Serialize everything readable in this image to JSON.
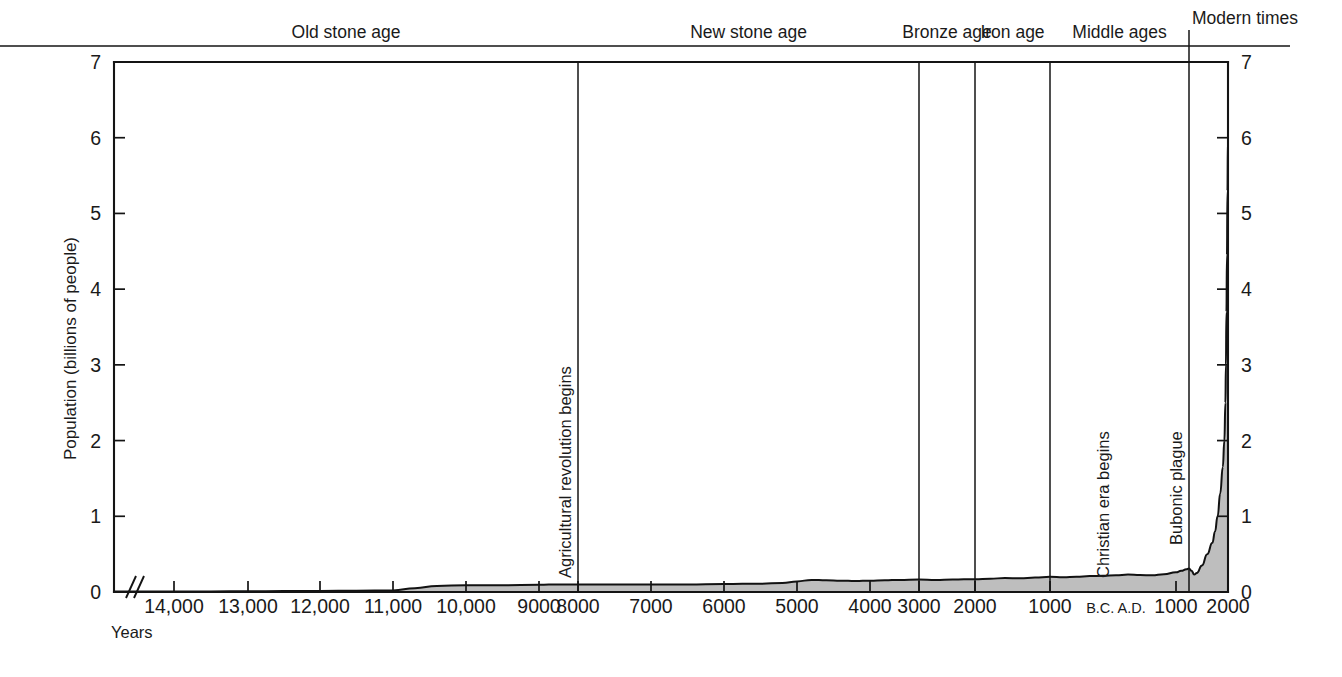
{
  "chart_data": {
    "type": "area",
    "title": "",
    "xlabel": "Years",
    "ylabel": "Population (billions of people)",
    "ylim": [
      0,
      7
    ],
    "grid": false,
    "legend": "none",
    "y_ticks": [
      "0",
      "1",
      "2",
      "3",
      "4",
      "5",
      "6",
      "7"
    ],
    "y_tick_values": [
      0,
      1,
      2,
      3,
      4,
      5,
      6,
      7
    ],
    "y_axis_both_sides": true,
    "x_axis_note": "Time axis running from about 15,000 B.C. on the left to A.D. 2000 on the right, with a break near the left end.",
    "x_ticks": [
      {
        "label": "14,000",
        "era": "B.C.",
        "year": -14000
      },
      {
        "label": "13,000",
        "era": "B.C.",
        "year": -13000
      },
      {
        "label": "12,000",
        "era": "B.C.",
        "year": -12000
      },
      {
        "label": "11,000",
        "era": "B.C.",
        "year": -11000
      },
      {
        "label": "10,000",
        "era": "B.C.",
        "year": -10000
      },
      {
        "label": "9000",
        "era": "B.C.",
        "year": -9000
      },
      {
        "label": "8000",
        "era": "B.C.",
        "year": -8000
      },
      {
        "label": "7000",
        "era": "B.C.",
        "year": -7000
      },
      {
        "label": "6000",
        "era": "B.C.",
        "year": -6000
      },
      {
        "label": "5000",
        "era": "B.C.",
        "year": -5000
      },
      {
        "label": "4000",
        "era": "B.C.",
        "year": -4000
      },
      {
        "label": "3000",
        "era": "B.C.",
        "year": -3000
      },
      {
        "label": "2000",
        "era": "B.C.",
        "year": -2000
      },
      {
        "label": "1000",
        "era": "B.C.",
        "year": -1000
      },
      {
        "label": "B.C. A.D.",
        "era": "boundary",
        "year": 0
      },
      {
        "label": "1000",
        "era": "A.D.",
        "year": 1000
      },
      {
        "label": "2000",
        "era": "A.D.",
        "year": 2000
      }
    ],
    "eras": [
      {
        "label": "Old stone age",
        "start_year": -15000,
        "end_year": -8000
      },
      {
        "label": "New stone age",
        "start_year": -8000,
        "end_year": -3000
      },
      {
        "label": "Bronze age",
        "start_year": -3000,
        "end_year": -2000
      },
      {
        "label": "Iron age",
        "start_year": -2000,
        "end_year": -1000
      },
      {
        "label": "Middle ages",
        "start_year": -1000,
        "end_year": 1250
      },
      {
        "label": "Modern times",
        "start_year": 1250,
        "end_year": 2000
      }
    ],
    "era_divider_years": [
      -8000,
      -3000,
      -2000,
      -1000,
      1250
    ],
    "annotations": [
      {
        "label": "Agricultural revolution begins",
        "year": -8000,
        "orientation": "vertical"
      },
      {
        "label": "Christian era begins",
        "year": 0,
        "orientation": "vertical"
      },
      {
        "label": "Bubonic plague",
        "year": 1250,
        "orientation": "vertical"
      }
    ],
    "series": [
      {
        "name": "World population",
        "units": "billions of people",
        "points": [
          {
            "year": -15000,
            "value": 0.005
          },
          {
            "year": -14500,
            "value": 0.006
          },
          {
            "year": -14000,
            "value": 0.007
          },
          {
            "year": -13500,
            "value": 0.008
          },
          {
            "year": -13000,
            "value": 0.01
          },
          {
            "year": -12500,
            "value": 0.012
          },
          {
            "year": -12000,
            "value": 0.014
          },
          {
            "year": -11500,
            "value": 0.017
          },
          {
            "year": -11000,
            "value": 0.02
          },
          {
            "year": -10700,
            "value": 0.05
          },
          {
            "year": -10400,
            "value": 0.08
          },
          {
            "year": -10000,
            "value": 0.09
          },
          {
            "year": -9500,
            "value": 0.09
          },
          {
            "year": -9000,
            "value": 0.095
          },
          {
            "year": -8500,
            "value": 0.1
          },
          {
            "year": -8000,
            "value": 0.1
          },
          {
            "year": -7500,
            "value": 0.1
          },
          {
            "year": -7000,
            "value": 0.1
          },
          {
            "year": -6500,
            "value": 0.1
          },
          {
            "year": -6000,
            "value": 0.105
          },
          {
            "year": -5500,
            "value": 0.11
          },
          {
            "year": -5200,
            "value": 0.12
          },
          {
            "year": -5000,
            "value": 0.14
          },
          {
            "year": -4800,
            "value": 0.16
          },
          {
            "year": -4600,
            "value": 0.155
          },
          {
            "year": -4400,
            "value": 0.15
          },
          {
            "year": -4200,
            "value": 0.145
          },
          {
            "year": -4000,
            "value": 0.15
          },
          {
            "year": -3700,
            "value": 0.155
          },
          {
            "year": -3400,
            "value": 0.16
          },
          {
            "year": -3000,
            "value": 0.165
          },
          {
            "year": -2700,
            "value": 0.16
          },
          {
            "year": -2400,
            "value": 0.165
          },
          {
            "year": -2000,
            "value": 0.17
          },
          {
            "year": -1800,
            "value": 0.175
          },
          {
            "year": -1600,
            "value": 0.185
          },
          {
            "year": -1400,
            "value": 0.18
          },
          {
            "year": -1200,
            "value": 0.19
          },
          {
            "year": -1000,
            "value": 0.2
          },
          {
            "year": -800,
            "value": 0.195
          },
          {
            "year": -600,
            "value": 0.2
          },
          {
            "year": -400,
            "value": 0.21
          },
          {
            "year": -200,
            "value": 0.215
          },
          {
            "year": 0,
            "value": 0.22
          },
          {
            "year": 200,
            "value": 0.23
          },
          {
            "year": 400,
            "value": 0.225
          },
          {
            "year": 600,
            "value": 0.22
          },
          {
            "year": 800,
            "value": 0.235
          },
          {
            "year": 1000,
            "value": 0.26
          },
          {
            "year": 1100,
            "value": 0.28
          },
          {
            "year": 1200,
            "value": 0.3
          },
          {
            "year": 1250,
            "value": 0.31
          },
          {
            "year": 1300,
            "value": 0.28
          },
          {
            "year": 1350,
            "value": 0.23
          },
          {
            "year": 1400,
            "value": 0.25
          },
          {
            "year": 1500,
            "value": 0.35
          },
          {
            "year": 1600,
            "value": 0.5
          },
          {
            "year": 1700,
            "value": 0.65
          },
          {
            "year": 1750,
            "value": 0.8
          },
          {
            "year": 1800,
            "value": 1.0
          },
          {
            "year": 1850,
            "value": 1.3
          },
          {
            "year": 1900,
            "value": 1.65
          },
          {
            "year": 1930,
            "value": 2.0
          },
          {
            "year": 1950,
            "value": 2.5
          },
          {
            "year": 1960,
            "value": 3.0
          },
          {
            "year": 1970,
            "value": 3.7
          },
          {
            "year": 1980,
            "value": 4.45
          },
          {
            "year": 1990,
            "value": 5.3
          },
          {
            "year": 1999,
            "value": 6.0
          }
        ]
      }
    ]
  }
}
